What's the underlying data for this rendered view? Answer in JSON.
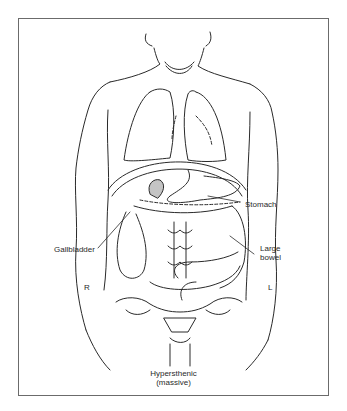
{
  "figure": {
    "caption_line1": "Hypersthenic",
    "caption_line2": "(massive)",
    "labels": {
      "stomach": "Stomach",
      "gallbladder": "Gallbladder",
      "large_bowel_line1": "Large",
      "large_bowel_line2": "bowel",
      "right": "R",
      "left": "L"
    },
    "colors": {
      "line": "#2a2a2a",
      "frame": "#6b6b6b",
      "background": "#ffffff"
    }
  }
}
